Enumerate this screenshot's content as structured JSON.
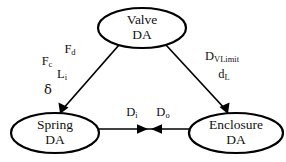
{
  "diagram": {
    "type": "directed-graph",
    "title": "",
    "background_color": "#ffffff",
    "stroke_color": "#000000",
    "text_color": "#111111",
    "nodes": [
      {
        "id": "valve",
        "shape": "ellipse",
        "line1": "Valve",
        "line2": "DA",
        "cx": 142,
        "cy": 28,
        "rx": 44,
        "ry": 20
      },
      {
        "id": "spring",
        "shape": "ellipse",
        "line1": "Spring",
        "line2": "DA",
        "cx": 55,
        "cy": 133,
        "rx": 44,
        "ry": 20
      },
      {
        "id": "enclosure",
        "shape": "ellipse",
        "line1": "Enclosure",
        "line2": "DA",
        "cx": 236,
        "cy": 133,
        "rx": 47,
        "ry": 20
      }
    ],
    "edges": [
      {
        "id": "valve-to-spring",
        "from": "valve",
        "to": "spring",
        "direction": "one-way",
        "arrowheads": 1
      },
      {
        "id": "valve-to-enclosure",
        "from": "valve",
        "to": "enclosure",
        "direction": "one-way",
        "arrowheads": 1
      },
      {
        "id": "spring-enclosure",
        "from": "spring",
        "to": "enclosure",
        "direction": "bidirectional",
        "arrowheads": 2
      }
    ],
    "edge_labels": {
      "left_group": [
        {
          "id": "Fc",
          "base": "F",
          "sub": "c",
          "x": 47,
          "y": 62
        },
        {
          "id": "Fd",
          "base": "F",
          "sub": "d",
          "x": 70,
          "y": 50
        },
        {
          "id": "Li",
          "base": "L",
          "sub": "i",
          "x": 62,
          "y": 75
        },
        {
          "id": "delta",
          "base": "δ",
          "sub": "",
          "x": 48,
          "y": 90
        }
      ],
      "right_group": [
        {
          "id": "DVLimit",
          "base": "D",
          "sub": "VLimit",
          "x": 222,
          "y": 57
        },
        {
          "id": "dL",
          "base": "d",
          "sub": "L",
          "x": 224,
          "y": 75
        }
      ],
      "center_group": [
        {
          "id": "Di",
          "base": "D",
          "sub": "i",
          "x": 132,
          "y": 113
        },
        {
          "id": "Do",
          "base": "D",
          "sub": "o",
          "x": 163,
          "y": 113
        }
      ]
    }
  }
}
